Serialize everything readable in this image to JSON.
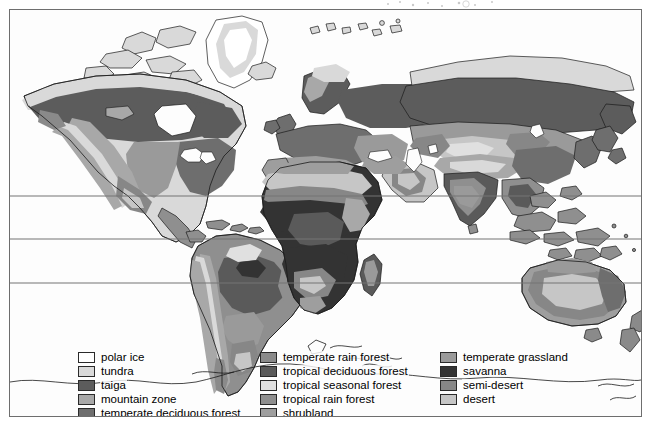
{
  "figure": {
    "kind": "world-biome-map",
    "frame_border_color": "#6e6e6e",
    "background_color": "#fdfdfd"
  },
  "map": {
    "ocean_color": "#fdfdfd",
    "coastline_color": "#1a1a1a",
    "latitude_lines": [
      {
        "name": "tropic-of-cancer",
        "y": 186
      },
      {
        "name": "equator",
        "y": 229
      },
      {
        "name": "tropic-of-capricorn",
        "y": 273
      }
    ],
    "latitude_line_color": "#757575"
  },
  "biome_colors": {
    "polar_ice": "#ffffff",
    "tundra": "#d9d9d9",
    "taiga": "#5c5c5c",
    "mountain_zone": "#a8a8a8",
    "temperate_deciduous_forest": "#6e6e6e",
    "temperate_rain_forest": "#8a8a8a",
    "tropical_deciduous_forest": "#5a5a5a",
    "tropical_seasonal_forest": "#e0e0e0",
    "tropical_rain_forest": "#8f8f8f",
    "shrubland": "#9e9e9e",
    "temperate_grassland": "#9a9a9a",
    "savanna": "#333333",
    "semi_desert": "#878787",
    "desert": "#c6c6c6"
  },
  "legend": {
    "columns": [
      {
        "name": "legend-column-1",
        "items": [
          {
            "label": "polar ice",
            "color": "#ffffff",
            "key": "polar_ice"
          },
          {
            "label": "tundra",
            "color": "#d9d9d9",
            "key": "tundra"
          },
          {
            "label": "taiga",
            "color": "#5c5c5c",
            "key": "taiga"
          },
          {
            "label": "mountain zone",
            "color": "#a8a8a8",
            "key": "mountain_zone"
          },
          {
            "label": "temperate deciduous forest",
            "color": "#6e6e6e",
            "key": "temperate_deciduous_forest"
          }
        ]
      },
      {
        "name": "legend-column-2",
        "items": [
          {
            "label": "temperate rain forest",
            "color": "#8a8a8a",
            "key": "temperate_rain_forest"
          },
          {
            "label": "tropical deciduous forest",
            "color": "#5a5a5a",
            "key": "tropical_deciduous_forest"
          },
          {
            "label": "tropical seasonal forest",
            "color": "#e0e0e0",
            "key": "tropical_seasonal_forest"
          },
          {
            "label": "tropical rain forest",
            "color": "#8f8f8f",
            "key": "tropical_rain_forest"
          },
          {
            "label": "shrubland",
            "color": "#9e9e9e",
            "key": "shrubland"
          }
        ]
      },
      {
        "name": "legend-column-3",
        "items": [
          {
            "label": "temperate grassland",
            "color": "#9a9a9a",
            "key": "temperate_grassland"
          },
          {
            "label": "savanna",
            "color": "#333333",
            "key": "savanna"
          },
          {
            "label": "semi-desert",
            "color": "#878787",
            "key": "semi_desert"
          },
          {
            "label": "desert",
            "color": "#c6c6c6",
            "key": "desert"
          }
        ]
      }
    ]
  }
}
